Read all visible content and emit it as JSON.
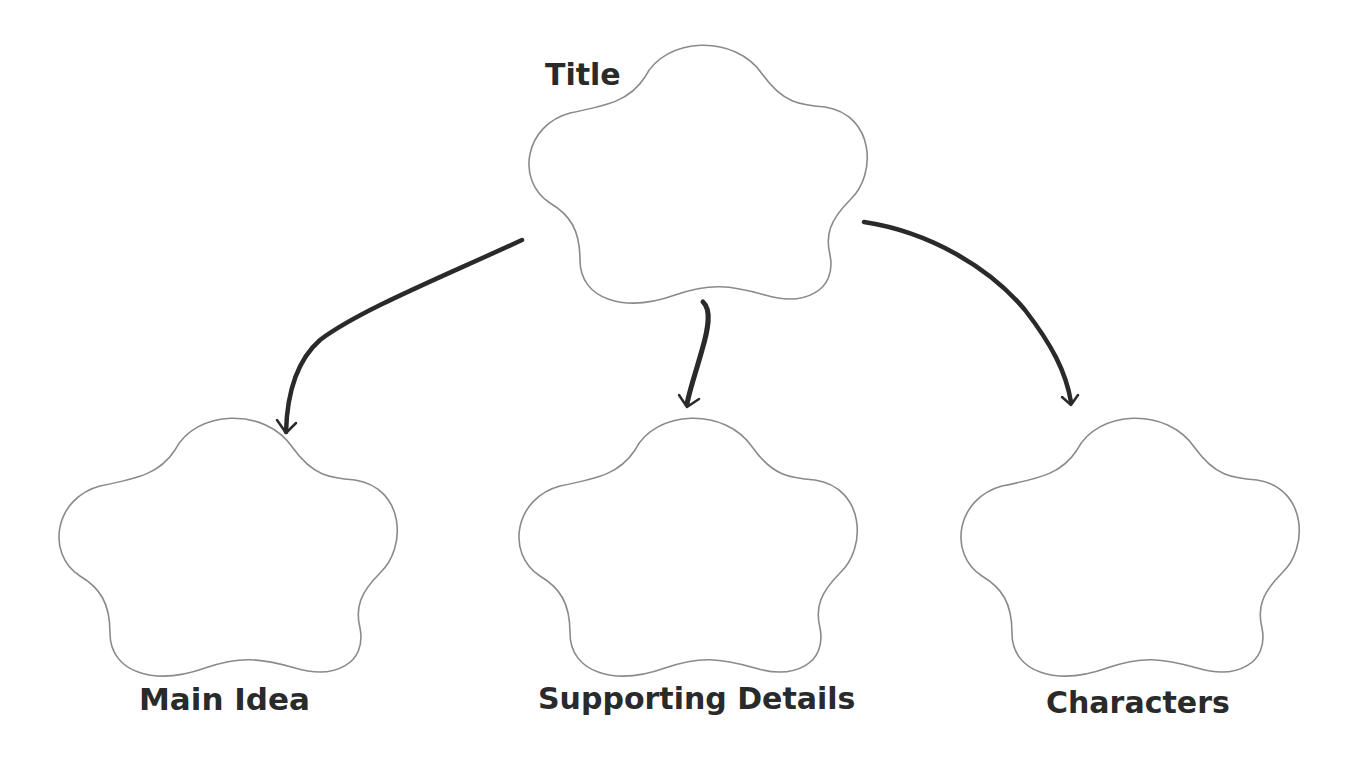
{
  "diagram": {
    "type": "graphic-organizer",
    "background_color": "#ffffff",
    "shape_stroke_color": "#8a8a8a",
    "arrow_color": "#2a2a2a",
    "label_color": "#2a2a2a",
    "nodes": [
      {
        "id": "title",
        "label": "Title",
        "shape": "flower"
      },
      {
        "id": "main_idea",
        "label": "Main Idea",
        "shape": "flower"
      },
      {
        "id": "supporting_details",
        "label": "Supporting Details",
        "shape": "flower"
      },
      {
        "id": "characters",
        "label": "Characters",
        "shape": "flower"
      }
    ],
    "edges": [
      {
        "from": "title",
        "to": "main_idea"
      },
      {
        "from": "title",
        "to": "supporting_details"
      },
      {
        "from": "title",
        "to": "characters"
      }
    ]
  }
}
